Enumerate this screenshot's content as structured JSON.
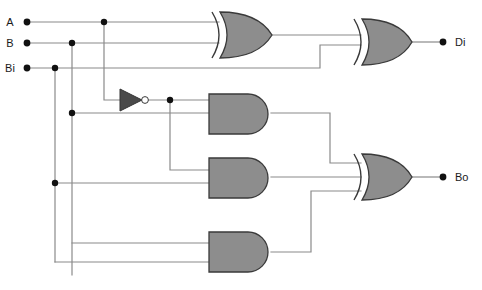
{
  "diagram": {
    "width": 482,
    "height": 290,
    "background": "#ffffff",
    "gate_fill": "#8d8d8d",
    "gate_stroke": "#3a3a3a",
    "wire_color": "#8a8a8a",
    "node_color": "#111111"
  },
  "inputs": [
    {
      "id": "A",
      "label": "A",
      "x": 27,
      "y": 22,
      "dot_x": 27,
      "dot_y": 22
    },
    {
      "id": "B",
      "label": "B",
      "x": 27,
      "y": 43,
      "dot_x": 27,
      "dot_y": 43
    },
    {
      "id": "Bi",
      "label": "Bi",
      "x": 27,
      "y": 68,
      "dot_x": 27,
      "dot_y": 68
    }
  ],
  "outputs": [
    {
      "id": "Di",
      "label": "Di",
      "dot_x": 443,
      "dot_y": 42
    },
    {
      "id": "Bo",
      "label": "Bo",
      "dot_x": 443,
      "dot_y": 177
    }
  ],
  "gates": [
    {
      "id": "xor1",
      "type": "xor",
      "label": "XOR",
      "x": 210,
      "y": 12,
      "w": 62,
      "h": 46,
      "inputs": [
        "A",
        "B"
      ],
      "output": "A xor B"
    },
    {
      "id": "xor2",
      "type": "xor",
      "label": "XOR",
      "x": 352,
      "y": 15,
      "w": 60,
      "h": 46,
      "inputs": [
        "A xor B",
        "Bi"
      ],
      "output": "Di"
    },
    {
      "id": "not1",
      "type": "not",
      "label": "NOT",
      "x": 120,
      "y": 89,
      "w": 28,
      "h": 22,
      "inputs": [
        "A"
      ],
      "output": "A'"
    },
    {
      "id": "and1",
      "type": "and",
      "label": "AND",
      "x": 209,
      "y": 94,
      "w": 62,
      "h": 40,
      "inputs": [
        "A'",
        "B"
      ],
      "output": "A'B"
    },
    {
      "id": "and2",
      "type": "and",
      "label": "AND",
      "x": 209,
      "y": 158,
      "w": 62,
      "h": 40,
      "inputs": [
        "A'",
        "Bi"
      ],
      "output": "A'Bi"
    },
    {
      "id": "and3",
      "type": "and",
      "label": "AND",
      "x": 209,
      "y": 232,
      "w": 62,
      "h": 40,
      "inputs": [
        "B",
        "Bi"
      ],
      "output": "B Bi"
    },
    {
      "id": "or1",
      "type": "xor",
      "label": "OR",
      "x": 352,
      "y": 150,
      "w": 60,
      "h": 46,
      "inputs": [
        "A'B",
        "A'Bi",
        "B Bi"
      ],
      "output": "Bo"
    }
  ],
  "junctions": [
    {
      "id": "j-a-tap",
      "x": 104,
      "y": 22
    },
    {
      "id": "j-b-tap",
      "x": 72,
      "y": 43
    },
    {
      "id": "j-bi-tap",
      "x": 55,
      "y": 68
    },
    {
      "id": "j-not-out",
      "x": 170,
      "y": 100
    },
    {
      "id": "j-b-down",
      "x": 72,
      "y": 113
    },
    {
      "id": "j-bi-down",
      "x": 55,
      "y": 183
    }
  ],
  "labels": {
    "input_a": "A",
    "input_b": "B",
    "input_bi": "Bi",
    "output_di": "Di",
    "output_bo": "Bo"
  }
}
